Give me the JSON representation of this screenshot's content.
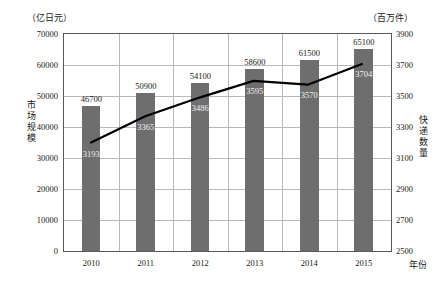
{
  "units": {
    "left": "（亿日元）",
    "right": "（百万件）"
  },
  "axis_titles": {
    "left": "市场规模",
    "right": "快递数量",
    "x": "年份"
  },
  "chart_data": {
    "type": "bar",
    "title": "",
    "xlabel": "年份",
    "categories": [
      "2010",
      "2011",
      "2012",
      "2013",
      "2014",
      "2015"
    ],
    "series": [
      {
        "name": "市场规模",
        "type": "bar",
        "axis": "left",
        "unit": "亿日元",
        "color": "#6e6e6e",
        "values": [
          46700,
          50900,
          54100,
          58600,
          61500,
          65100
        ],
        "labels": [
          "46700",
          "50900",
          "54100",
          "58600",
          "61500",
          "65100"
        ]
      },
      {
        "name": "快递数量",
        "type": "line",
        "axis": "right",
        "unit": "百万件",
        "color": "#000000",
        "values": [
          3193,
          3365,
          3486,
          3595,
          3570,
          3704
        ],
        "labels": [
          "3193",
          "3365",
          "3486",
          "3595",
          "3570",
          "3704"
        ]
      }
    ],
    "left_axis": {
      "label": "市场规模",
      "unit": "（亿日元）",
      "min": 0,
      "max": 70000,
      "step": 10000,
      "ticks": [
        "0",
        "10000",
        "20000",
        "30000",
        "40000",
        "50000",
        "60000",
        "70000"
      ]
    },
    "right_axis": {
      "label": "快递数量",
      "unit": "（百万件）",
      "min": 2500,
      "max": 3900,
      "step": 200,
      "ticks": [
        "2500",
        "2700",
        "2900",
        "3100",
        "3300",
        "3500",
        "3700",
        "3900"
      ]
    },
    "grid": true,
    "legend": "none"
  }
}
